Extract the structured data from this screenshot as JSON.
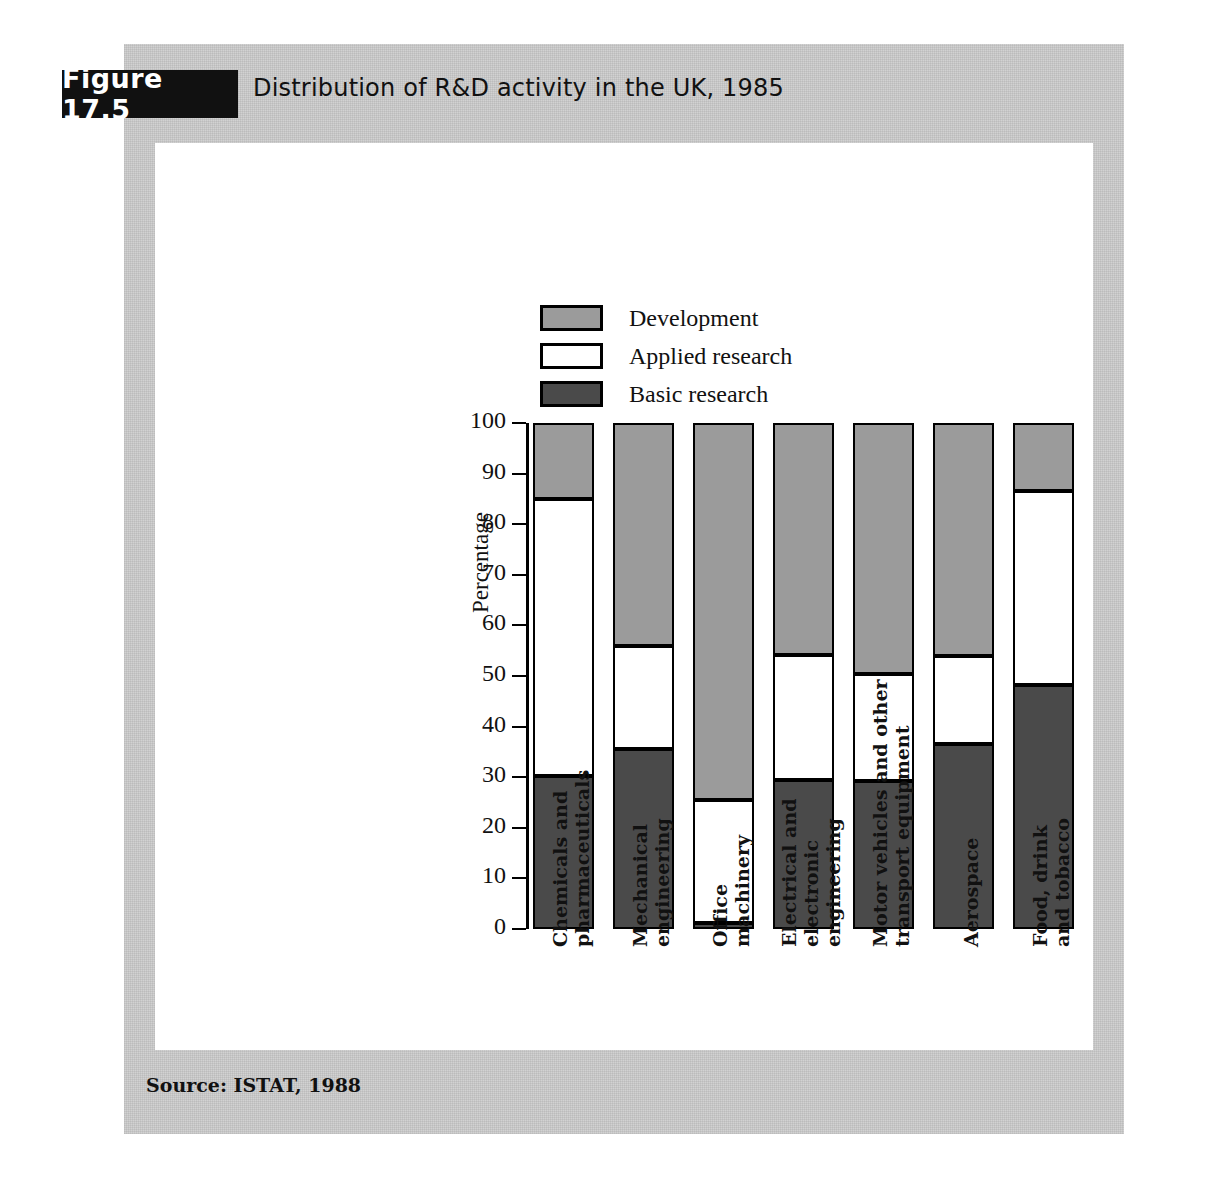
{
  "figure": {
    "badge": "Figure 17.5",
    "title": "Distribution of R&D activity in the UK, 1985",
    "source": "Source: ISTAT, 1988"
  },
  "colors": {
    "development": "#9b9b9b",
    "applied_research": "#ffffff",
    "basic_research": "#4a4a4a",
    "outline": "#000000",
    "panel_background": "#d2d2d2",
    "card_background": "#ffffff",
    "badge_background": "#111111"
  },
  "legend": {
    "position": "top-left-inside",
    "items": [
      {
        "label": "Development",
        "key": "development",
        "swatch": "#9b9b9b"
      },
      {
        "label": "Applied research",
        "key": "applied_research",
        "swatch": "#ffffff"
      },
      {
        "label": "Basic research",
        "key": "basic_research",
        "swatch": "#4a4a4a"
      }
    ]
  },
  "chart_data": {
    "type": "bar",
    "subtype": "stacked-vertical-100-percent",
    "title": "Distribution of R&D activity in the UK, 1985",
    "xlabel": "",
    "ylabel": "Percentage",
    "ylim": [
      0,
      100
    ],
    "yticks": [
      0,
      10,
      20,
      30,
      40,
      50,
      60,
      70,
      80,
      90,
      100
    ],
    "ytick_labels": [
      "0",
      "10",
      "20",
      "30",
      "40",
      "50",
      "60",
      "70",
      "80",
      "90",
      "100"
    ],
    "grid": false,
    "legend_entries": [
      "Development",
      "Applied research",
      "Basic research"
    ],
    "categories": [
      "Chemicals and pharmaceuticals",
      "Mechanical engineering",
      "Office machinery",
      "Electrical and electronic engineering",
      "Motor vehicles and other transport equipment",
      "Aerospace",
      "Food, drink and tobacco"
    ],
    "category_lines": [
      [
        "Chemicals and",
        "pharmaceuticals"
      ],
      [
        "Mechanical",
        "engineering"
      ],
      [
        "Office",
        "machinery"
      ],
      [
        "Electrical and",
        "electronic",
        "engineering"
      ],
      [
        "Motor vehicles and other",
        "transport equipment"
      ],
      [
        "Aerospace"
      ],
      [
        "Food, drink",
        "and tobacco"
      ]
    ],
    "series": [
      {
        "name": "Basic research",
        "color": "#4a4a4a",
        "values": [
          30.3,
          35.5,
          1.2,
          29.5,
          29.3,
          36.5,
          48.3
        ]
      },
      {
        "name": "Applied research",
        "color": "#ffffff",
        "values": [
          54.7,
          20.5,
          24.3,
          24.7,
          21.0,
          17.5,
          38.3
        ]
      },
      {
        "name": "Development",
        "color": "#9b9b9b",
        "values": [
          15.0,
          44.0,
          74.5,
          45.8,
          49.7,
          46.0,
          13.4
        ]
      }
    ],
    "cumulative_tops": {
      "basic_research": [
        30.3,
        35.5,
        1.2,
        29.5,
        29.3,
        36.5,
        48.3
      ],
      "applied_research": [
        85.0,
        56.0,
        25.5,
        54.2,
        50.3,
        54.0,
        86.6
      ],
      "development": [
        100,
        100,
        100,
        100,
        100,
        100,
        100
      ]
    }
  }
}
